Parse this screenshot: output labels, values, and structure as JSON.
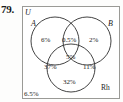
{
  "problem": {
    "number": "79."
  },
  "diagram": {
    "type": "venn",
    "universe_label": "U",
    "sets": [
      {
        "id": "A",
        "label": "A"
      },
      {
        "id": "B",
        "label": "B"
      },
      {
        "id": "Rh",
        "label": "Rh"
      }
    ],
    "regions": [
      {
        "id": "a-only",
        "label": "6%"
      },
      {
        "id": "a-b",
        "label": "0.5%"
      },
      {
        "id": "b-only",
        "label": "2%"
      },
      {
        "id": "a-b-rh",
        "label": "5%"
      },
      {
        "id": "a-rh",
        "label": "37%"
      },
      {
        "id": "b-rh",
        "label": "11%"
      },
      {
        "id": "rh-only",
        "label": "32%"
      },
      {
        "id": "outside-all",
        "label": "6.5%"
      }
    ],
    "colors": {
      "stroke": "#2e2e2e",
      "box_border": "#9a9a96",
      "background": "#ffffff",
      "text": "#1c1c1c"
    }
  }
}
